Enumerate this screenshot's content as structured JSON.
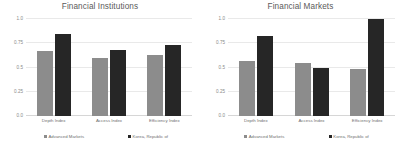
{
  "chart_data": [
    {
      "type": "bar",
      "title": "Financial Institutions",
      "xlabel": "",
      "ylabel": "",
      "ylim": [
        0,
        1.0
      ],
      "yticks": [
        "0.0",
        "0.25",
        "0.5",
        "0.75",
        "1.0"
      ],
      "ytick_values": [
        0,
        0.25,
        0.5,
        0.75,
        1.0
      ],
      "grid": true,
      "legend_position": "bottom",
      "categories": [
        "Depth Index",
        "Access Index",
        "Efficiency Index"
      ],
      "series": [
        {
          "name": "Advanced Markets",
          "color": "#8c8c8c",
          "values": [
            0.67,
            0.6,
            0.63
          ]
        },
        {
          "name": "Korea, Republic of",
          "color": "#262626",
          "values": [
            0.85,
            0.68,
            0.73
          ]
        }
      ]
    },
    {
      "type": "bar",
      "title": "Financial Markets",
      "xlabel": "",
      "ylabel": "",
      "ylim": [
        0,
        1.0
      ],
      "yticks": [
        "0.0",
        "0.25",
        "0.5",
        "0.75",
        "1.0"
      ],
      "ytick_values": [
        0,
        0.25,
        0.5,
        0.75,
        1.0
      ],
      "grid": true,
      "legend_position": "bottom",
      "categories": [
        "Depth Index",
        "Access Index",
        "Efficiency Index"
      ],
      "series": [
        {
          "name": "Advanced Markets",
          "color": "#8c8c8c",
          "values": [
            0.57,
            0.55,
            0.48
          ]
        },
        {
          "name": "Korea, Republic of",
          "color": "#262626",
          "values": [
            0.83,
            0.49,
            1.0
          ]
        }
      ]
    }
  ]
}
